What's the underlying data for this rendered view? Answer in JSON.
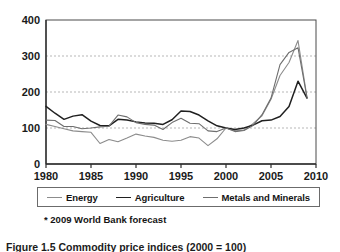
{
  "chart_data": {
    "type": "line",
    "title": "",
    "xlabel": "",
    "ylabel": "",
    "xlim": [
      1980,
      2010
    ],
    "ylim": [
      0,
      400
    ],
    "xticks": [
      "1980",
      "1985",
      "1990",
      "1995",
      "2000",
      "2005",
      "2010"
    ],
    "yticks": [
      "0",
      "100",
      "200",
      "300",
      "400"
    ],
    "grid": "horizontal-dashed",
    "legend_position": "below-plot",
    "x": [
      1980,
      1981,
      1982,
      1983,
      1984,
      1985,
      1986,
      1987,
      1988,
      1989,
      1990,
      1991,
      1992,
      1993,
      1994,
      1995,
      1996,
      1997,
      1998,
      1999,
      2000,
      2001,
      2002,
      2003,
      2004,
      2005,
      2006,
      2007,
      2008,
      2009
    ],
    "series": [
      {
        "name": "Energy",
        "color": "#8c8c8c",
        "values": [
          110,
          104,
          98,
          92,
          90,
          88,
          57,
          68,
          62,
          72,
          83,
          78,
          74,
          66,
          63,
          66,
          76,
          72,
          51,
          70,
          100,
          92,
          94,
          112,
          134,
          180,
          246,
          282,
          343,
          185
        ]
      },
      {
        "name": "Agriculture",
        "color": "#202020",
        "values": [
          160,
          141,
          124,
          133,
          137,
          119,
          107,
          106,
          124,
          122,
          117,
          114,
          113,
          110,
          123,
          147,
          146,
          136,
          120,
          106,
          100,
          96,
          100,
          108,
          120,
          122,
          132,
          160,
          230,
          183
        ]
      },
      {
        "name": "Metals and Minerals",
        "color": "#6e6e6e",
        "values": [
          122,
          121,
          104,
          104,
          98,
          100,
          103,
          105,
          136,
          131,
          115,
          110,
          108,
          96,
          115,
          127,
          113,
          112,
          92,
          90,
          100,
          90,
          93,
          107,
          137,
          183,
          276,
          310,
          323,
          184
        ]
      }
    ]
  },
  "footnote": "* 2009 World Bank forecast",
  "caption": "Figure 1.5 Commodity price indices (2000 = 100)"
}
